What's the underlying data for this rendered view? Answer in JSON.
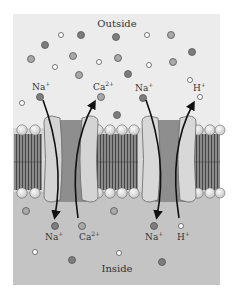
{
  "figure": {
    "region_top_label": "Outside",
    "region_bottom_label": "Inside",
    "colors": {
      "outside_bg": "#ececec",
      "inside_bg": "#c4c4c4",
      "page_bg": "#ffffff",
      "channel_outer": "#d4d4d4",
      "channel_core": "#8e8e8e",
      "lipid_head": "#efefef",
      "lipid_tail": "#7a7a7a",
      "ion_dark": "#7d7d7d",
      "ion_mid": "#a9a9a9",
      "ion_light": "#ffffff",
      "arrow": "#111111"
    },
    "transporters": [
      {
        "name": "Na-Ca exchanger",
        "top_labels": [
          {
            "ion": "Na",
            "charge": "+"
          },
          {
            "ion": "Ca",
            "charge": "2+"
          }
        ],
        "bottom_labels": [
          {
            "ion": "Na",
            "charge": "+"
          },
          {
            "ion": "Ca",
            "charge": "2+"
          }
        ]
      },
      {
        "name": "Na-H exchanger",
        "top_labels": [
          {
            "ion": "Na",
            "charge": "+"
          },
          {
            "ion": "H",
            "charge": "+"
          }
        ],
        "bottom_labels": [
          {
            "ion": "Na",
            "charge": "+"
          },
          {
            "ion": "H",
            "charge": "+"
          }
        ]
      }
    ],
    "labels": {
      "t1_top_na": "Na",
      "t1_top_na_sup": "+",
      "t1_top_ca": "Ca",
      "t1_top_ca_sup": "2+",
      "t2_top_na": "Na",
      "t2_top_na_sup": "+",
      "t2_top_h": "H",
      "t2_top_h_sup": "+",
      "t1_bot_na": "Na",
      "t1_bot_na_sup": "+",
      "t1_bot_ca": "Ca",
      "t1_bot_ca_sup": "2+",
      "t2_bot_na": "Na",
      "t2_bot_na_sup": "+",
      "t2_bot_h": "H",
      "t2_bot_h_sup": "+"
    }
  }
}
